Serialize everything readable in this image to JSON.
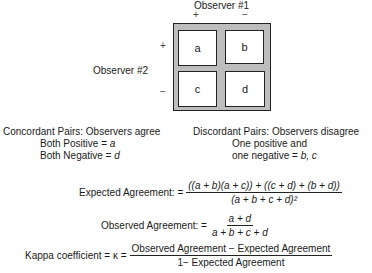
{
  "diagram": {
    "observer1_label": "Observer #1",
    "observer2_label": "Observer #2",
    "col_signs": [
      "+",
      "−"
    ],
    "row_signs": [
      "+",
      "−"
    ],
    "cells": [
      "a",
      "b",
      "c",
      "d"
    ],
    "colors": {
      "frame": "#bdbdbd",
      "border": "#222222",
      "cell_bg": "#ffffff"
    }
  },
  "concordant": {
    "title": "Concordant Pairs: Observers agree",
    "line1_prefix": "Both Positive = ",
    "line1_var": "a",
    "line2_prefix": "Both Negative = ",
    "line2_var": "d"
  },
  "discordant": {
    "title": "Discordant Pairs: Observers disagree",
    "line1": "One positive and",
    "line2_prefix": "one negative = ",
    "line2_vars": "b, c"
  },
  "formulas": {
    "expected": {
      "label": "Expected Agreement: =",
      "numerator": "((a + b)(a + c)) + ((c + d) + (b + d))",
      "denominator": "(a + b + c + d)²"
    },
    "observed": {
      "label": "Observed Agreement: =",
      "numerator": "a + d",
      "denominator": "a + b + c + d"
    },
    "kappa": {
      "label": "Kappa coefficient = κ =",
      "numerator": "Observed Agreement − Expected Agreement",
      "denominator": "1− Expected Agreement"
    }
  }
}
